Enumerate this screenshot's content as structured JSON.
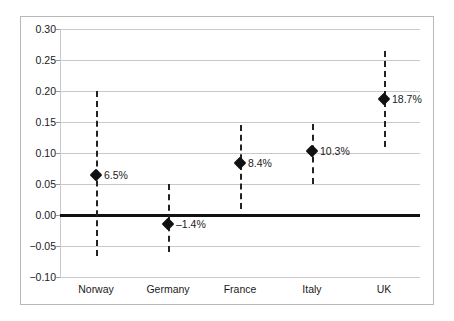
{
  "chart_data": {
    "type": "scatter",
    "title": "",
    "subtitle": "",
    "xlabel": "",
    "ylabel": "",
    "categories": [
      "Norway",
      "Germany",
      "France",
      "Italy",
      "UK"
    ],
    "values": [
      0.065,
      -0.014,
      0.084,
      0.103,
      0.187
    ],
    "data_labels": [
      "6.5%",
      "–1.4%",
      "8.4%",
      "10.3%",
      "18.7%"
    ],
    "error_low": [
      -0.066,
      -0.06,
      0.01,
      0.05,
      0.11
    ],
    "error_high": [
      0.2,
      0.05,
      0.145,
      0.147,
      0.265
    ],
    "ylim": [
      -0.1,
      0.3
    ],
    "yticks": [
      0.3,
      0.25,
      0.2,
      0.15,
      0.1,
      0.05,
      0.0,
      -0.05,
      -0.1
    ],
    "ytick_labels": [
      "0.30",
      "0.25",
      "0.20",
      "0.15",
      "0.10",
      "0.05",
      "0.00",
      "−0.05",
      "−0.10"
    ],
    "grid": true,
    "legend": "none",
    "zero_reference_line": 0.0,
    "marker_style": "diamond",
    "errorbar_style": "dashed-vertical",
    "colors": {
      "marker": "#111111",
      "errorbar": "#222222",
      "gridline": "#c9c9c9",
      "zeroline": "#111111",
      "frame": "#b8b8b8",
      "background": "#ffffff",
      "text": "#1a1a1a"
    }
  }
}
